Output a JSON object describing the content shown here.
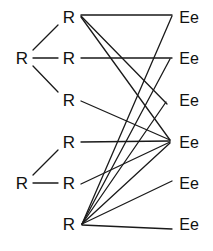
{
  "diagram": {
    "type": "bipartite-mapping-diagram",
    "stroke_color": "#1a1a1a",
    "background_color": "#ffffff",
    "text_color": "#111111",
    "left_tree_nodes": [
      {
        "id": "Ltop",
        "label": "R",
        "x": 22,
        "y": 58
      },
      {
        "id": "Lbot",
        "label": "R",
        "x": 22,
        "y": 183
      }
    ],
    "r_nodes": [
      {
        "id": "R1",
        "label": "R",
        "x": 69,
        "y": 17
      },
      {
        "id": "R2",
        "label": "R",
        "x": 69,
        "y": 58
      },
      {
        "id": "R3",
        "label": "R",
        "x": 69,
        "y": 100
      },
      {
        "id": "R4",
        "label": "R",
        "x": 69,
        "y": 142
      },
      {
        "id": "R5",
        "label": "R",
        "x": 69,
        "y": 183
      },
      {
        "id": "R6",
        "label": "R",
        "x": 69,
        "y": 224
      }
    ],
    "ee_nodes": [
      {
        "id": "E1",
        "label": "Ee",
        "x": 189,
        "y": 17
      },
      {
        "id": "E2",
        "label": "Ee",
        "x": 189,
        "y": 58
      },
      {
        "id": "E3",
        "label": "Ee",
        "x": 189,
        "y": 100
      },
      {
        "id": "E4",
        "label": "Ee",
        "x": 189,
        "y": 142
      },
      {
        "id": "E5",
        "label": "Ee",
        "x": 189,
        "y": 183
      },
      {
        "id": "E6",
        "label": "Ee",
        "x": 189,
        "y": 224
      }
    ],
    "tree_edges": [
      {
        "from": "Ltop",
        "to": "R1",
        "x1": 33,
        "y1": 50,
        "x2": 58,
        "y2": 25
      },
      {
        "from": "Ltop",
        "to": "R2",
        "x1": 33,
        "y1": 58,
        "x2": 58,
        "y2": 58
      },
      {
        "from": "Ltop",
        "to": "R3",
        "x1": 33,
        "y1": 66,
        "x2": 58,
        "y2": 92
      },
      {
        "from": "Lbot",
        "to": "R4",
        "x1": 33,
        "y1": 175,
        "x2": 58,
        "y2": 150
      },
      {
        "from": "Lbot",
        "to": "R5",
        "x1": 33,
        "y1": 183,
        "x2": 58,
        "y2": 183
      }
    ],
    "mapping_edges": [
      {
        "from": "R1",
        "to": "E1",
        "x1": 81,
        "y1": 15,
        "x2": 172,
        "y2": 15
      },
      {
        "from": "R1",
        "to": "E3",
        "x1": 81,
        "y1": 16,
        "x2": 167,
        "y2": 104
      },
      {
        "from": "R1",
        "to": "E4",
        "x1": 81,
        "y1": 17,
        "x2": 170,
        "y2": 140
      },
      {
        "from": "R2",
        "to": "E2",
        "x1": 81,
        "y1": 58,
        "x2": 172,
        "y2": 58
      },
      {
        "from": "R3",
        "to": "E4",
        "x1": 81,
        "y1": 101,
        "x2": 170,
        "y2": 140
      },
      {
        "from": "R4",
        "to": "E4",
        "x1": 81,
        "y1": 142,
        "x2": 170,
        "y2": 141
      },
      {
        "from": "R5",
        "to": "E4",
        "x1": 81,
        "y1": 184,
        "x2": 170,
        "y2": 142
      },
      {
        "from": "R6",
        "to": "E1",
        "x1": 82,
        "y1": 224,
        "x2": 172,
        "y2": 16
      },
      {
        "from": "R6",
        "to": "E2",
        "x1": 82,
        "y1": 224,
        "x2": 170,
        "y2": 59
      },
      {
        "from": "R6",
        "to": "E3",
        "x1": 82,
        "y1": 224,
        "x2": 166,
        "y2": 102
      },
      {
        "from": "R6",
        "to": "E4",
        "x1": 82,
        "y1": 224,
        "x2": 170,
        "y2": 143
      },
      {
        "from": "R6",
        "to": "E5",
        "x1": 82,
        "y1": 224,
        "x2": 172,
        "y2": 181
      },
      {
        "from": "R6",
        "to": "E6",
        "x1": 82,
        "y1": 225,
        "x2": 172,
        "y2": 229
      }
    ]
  }
}
